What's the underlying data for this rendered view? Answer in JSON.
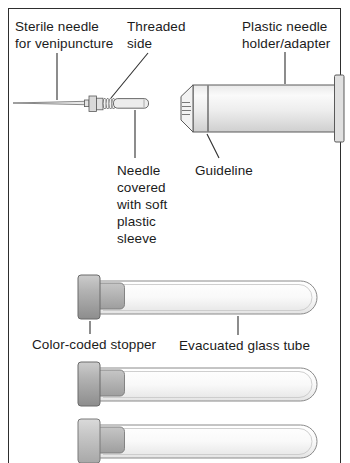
{
  "figure": {
    "labels": {
      "sterile_needle": "Sterile needle\nfor venipuncture",
      "threaded_side": "Threaded\nside",
      "plastic_holder": "Plastic needle\nholder/adapter",
      "needle_sleeve": "Needle\ncovered\nwith soft\nplastic\nsleeve",
      "guideline": "Guideline",
      "color_coded_stopper": "Color-coded stopper",
      "evacuated_tube": "Evacuated glass tube"
    },
    "colors": {
      "frame_border": "#2e2e2e",
      "leader_line": "#2f2f2f",
      "outline": "#5a5a5a",
      "tube_top": "#ffffff",
      "tube_mid": "#f9f9f9",
      "tube_bottom": "#e4e4e4",
      "tube_inner_line": "#c9c9c9",
      "cap_top": "#cccccc",
      "cap_mid": "#b3b3b3",
      "cap_bottom": "#8d8d8d",
      "cap_light_top": "#dadada",
      "cap_light_mid": "#c7c7c7",
      "cap_light_bottom": "#a8a8a8",
      "plug_top": "#c6c6c6",
      "plug_bottom": "#9e9e9e",
      "holder_top": "#e9e9e9",
      "holder_high": "#fafafa",
      "holder_mid": "#ededed",
      "holder_bottom": "#cfcfcf",
      "metal_fill": "#e0e0e0",
      "sleeve_fill": "#ededed"
    }
  }
}
